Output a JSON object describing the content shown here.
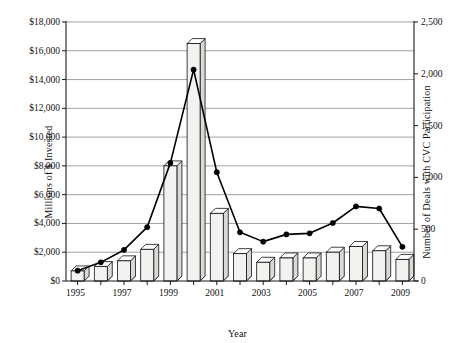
{
  "chart_data": {
    "type": "bar",
    "title": "",
    "xlabel": "Year",
    "ylabel": "Millions of $ Invested",
    "y2label": "Number of Deals with CVC Participation",
    "categories": [
      1995,
      1996,
      1997,
      1998,
      1999,
      2000,
      2001,
      2002,
      2003,
      2004,
      2005,
      2006,
      2007,
      2008,
      2009
    ],
    "x_tick_labels": [
      "1995",
      "",
      "1997",
      "",
      "1999",
      "",
      "2001",
      "",
      "2003",
      "",
      "2005",
      "",
      "2007",
      "",
      "2009"
    ],
    "ylim": [
      0,
      18000
    ],
    "y_ticks": [
      0,
      2000,
      4000,
      6000,
      8000,
      10000,
      12000,
      14000,
      16000,
      18000
    ],
    "y_tick_labels": [
      "$0",
      "$2,000",
      "$4,000",
      "$6,000",
      "$8,000",
      "$10,000",
      "$12,000",
      "$14,000",
      "$16,000",
      "$18,000"
    ],
    "y2lim": [
      0,
      2500
    ],
    "y2_ticks": [
      0,
      500,
      1000,
      1500,
      2000,
      2500
    ],
    "y2_tick_labels": [
      "0",
      "500",
      "1,000",
      "1,500",
      "2,000",
      "2,500"
    ],
    "grid": true,
    "legend": "none",
    "series": [
      {
        "name": "Millions of $ Invested",
        "type": "bar3d",
        "axis": "left",
        "values": [
          700,
          1000,
          1400,
          2200,
          8000,
          16500,
          4700,
          1900,
          1300,
          1600,
          1600,
          2000,
          2400,
          2100,
          1500
        ]
      },
      {
        "name": "Number of Deals with CVC Participation",
        "type": "line",
        "axis": "right",
        "values": [
          100,
          180,
          300,
          520,
          1140,
          2040,
          1050,
          470,
          380,
          450,
          460,
          560,
          720,
          700,
          330
        ]
      }
    ]
  }
}
